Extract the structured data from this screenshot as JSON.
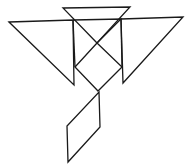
{
  "diagram": {
    "type": "tangram",
    "width": 185,
    "height": 167,
    "background": "#ffffff",
    "stroke_color": "#1a1a1a",
    "pieces": [
      {
        "name": "top-triangle",
        "points": "63,8 130,7 97,43"
      },
      {
        "name": "left-large-triangle",
        "points": "9,22 73,20 74,85"
      },
      {
        "name": "right-large-triangle",
        "points": "121,19 183,17 123,83"
      },
      {
        "name": "center-upper-triangle",
        "points": "73,20 121,19 97,43"
      },
      {
        "name": "center-square",
        "points": "97,43 122,67 98,91 75,67"
      },
      {
        "name": "left-connector-line",
        "points": "73,20 75,67"
      },
      {
        "name": "right-connector-line",
        "points": "121,19 122,67"
      },
      {
        "name": "parallelogram",
        "points": "99,92 100,127 68,162 67,126"
      }
    ]
  }
}
